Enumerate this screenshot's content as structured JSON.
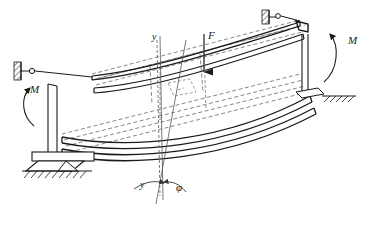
{
  "figure": {
    "type": "engineering-mechanics-diagram",
    "line_color": "#1a1a1a",
    "dashed_color": "#555555",
    "background": "#ffffff",
    "canvas": {
      "width": 370,
      "height": 226
    }
  },
  "labels": {
    "moment_left": "M",
    "moment_right": "M",
    "force": "F",
    "axis_y_top": "y",
    "axis_y_bottom": "y",
    "rotation_phi": "φ"
  },
  "elements": {
    "left_support": "hatched-wall-pin-support",
    "top_right_support": "hatched-wall-pin-support",
    "bottom_left_support": "base-plate-on-hatched-ground",
    "right_support": "base-plate-on-hatched-ground",
    "upper_beam": "deformed-beam-solid",
    "lower_beam": "deformed-beam-solid",
    "original_position": "undeformed-beam-dashed",
    "force_arrow": "downward-arrow",
    "moment_arrows": "curved-arrow",
    "vertical_column": "column-member"
  }
}
